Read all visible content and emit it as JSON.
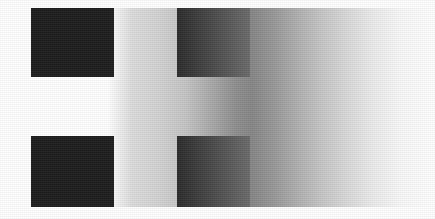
{
  "image": {
    "title": "Simultaneous Brightness Contrast Illusion",
    "width_px": 435,
    "height_px": 219,
    "canvas_background": "#ffffff"
  },
  "background": {
    "name": "horizontal-luminance-gradient",
    "band_top_px": 8,
    "band_height_px": 199,
    "left_color": "#ffffff",
    "darkest_color": "#868686",
    "darkest_x_px": 252,
    "right_color": "#ffffff",
    "stops": [
      {
        "x_px": 0,
        "color": "#ffffff"
      },
      {
        "x_px": 108,
        "color": "#ffffff"
      },
      {
        "x_px": 132,
        "color": "#dcdcdc"
      },
      {
        "x_px": 160,
        "color": "#d2d2d2"
      },
      {
        "x_px": 186,
        "color": "#c4c4c4"
      },
      {
        "x_px": 212,
        "color": "#a8a8a8"
      },
      {
        "x_px": 236,
        "color": "#8e8e8e"
      },
      {
        "x_px": 252,
        "color": "#868686"
      },
      {
        "x_px": 272,
        "color": "#969696"
      },
      {
        "x_px": 296,
        "color": "#aeaeae"
      },
      {
        "x_px": 322,
        "color": "#c6c6c6"
      },
      {
        "x_px": 348,
        "color": "#dadada"
      },
      {
        "x_px": 374,
        "color": "#ececec"
      },
      {
        "x_px": 400,
        "color": "#f8f8f8"
      },
      {
        "x_px": 435,
        "color": "#ffffff"
      }
    ]
  },
  "patches": [
    {
      "id": "top-left",
      "label": "Top-left test patch",
      "x_px": 31,
      "y_px": 8,
      "width_px": 83,
      "height_px": 69,
      "fill_type": "solid",
      "fill_color": "#1c1c1c",
      "surround": "white"
    },
    {
      "id": "top-right",
      "label": "Top-right test patch",
      "x_px": 177,
      "y_px": 8,
      "width_px": 73,
      "height_px": 69,
      "fill_type": "gradient",
      "fill_color_left": "#2a2a2a",
      "fill_color_right": "#6a6a6a",
      "surround": "gray-gradient"
    },
    {
      "id": "bottom-left",
      "label": "Bottom-left test patch",
      "x_px": 31,
      "y_px": 136,
      "width_px": 83,
      "height_px": 71,
      "fill_type": "solid",
      "fill_color": "#1c1c1c",
      "surround": "white"
    },
    {
      "id": "bottom-right",
      "label": "Bottom-right test patch",
      "x_px": 177,
      "y_px": 136,
      "width_px": 73,
      "height_px": 71,
      "fill_type": "gradient",
      "fill_color_left": "#2a2a2a",
      "fill_color_right": "#6a6a6a",
      "surround": "gray-gradient"
    }
  ],
  "texture": {
    "name": "halftone-dither-overlay",
    "opacity": 0.1
  }
}
